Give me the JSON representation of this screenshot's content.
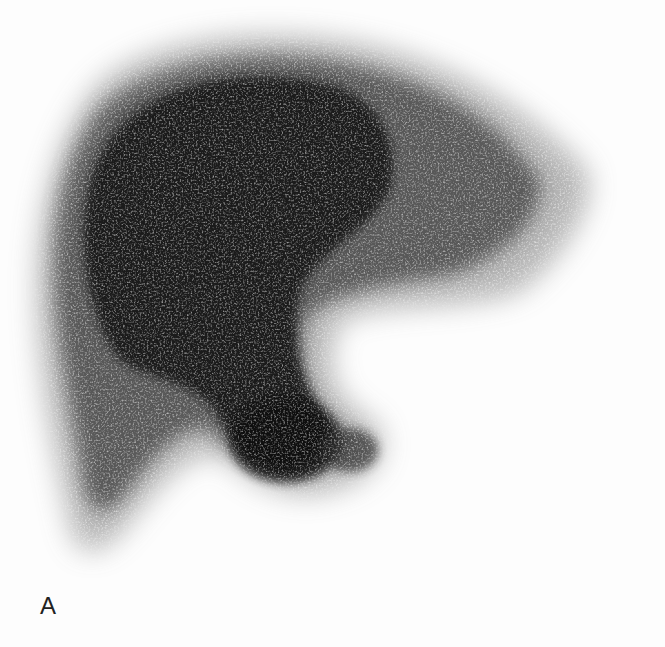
{
  "figure": {
    "panel_label": "A",
    "colors": {
      "background": "#fdfdfd",
      "tissue_dark": "#141414",
      "tissue_mid": "#555555",
      "tissue_light": "#9a9a9a"
    }
  }
}
